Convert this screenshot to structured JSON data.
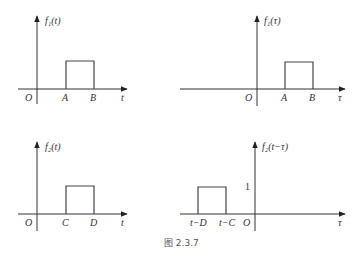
{
  "figure": {
    "caption": "图 2.3.7",
    "panels": [
      {
        "id": "f1-of-t",
        "y_label": "f₁(t)",
        "x_label": "t",
        "origin_label": "O",
        "pulse_start_label": "A",
        "pulse_end_label": "B"
      },
      {
        "id": "f1-of-tau",
        "y_label": "f₁(τ)",
        "x_label": "τ",
        "origin_label": "O",
        "pulse_start_label": "A",
        "pulse_end_label": "B"
      },
      {
        "id": "f2-of-t",
        "y_label": "f₂(t)",
        "x_label": "t",
        "origin_label": "O",
        "pulse_start_label": "C",
        "pulse_end_label": "D"
      },
      {
        "id": "f2-of-t-minus-tau",
        "y_label": "f₂(t−τ)",
        "x_label": "τ",
        "origin_label": "O",
        "pulse_start_label": "t−D",
        "pulse_end_label": "t−C",
        "height_label": "1"
      }
    ]
  },
  "colors": {
    "line": "#333333",
    "caption": "#555555"
  }
}
